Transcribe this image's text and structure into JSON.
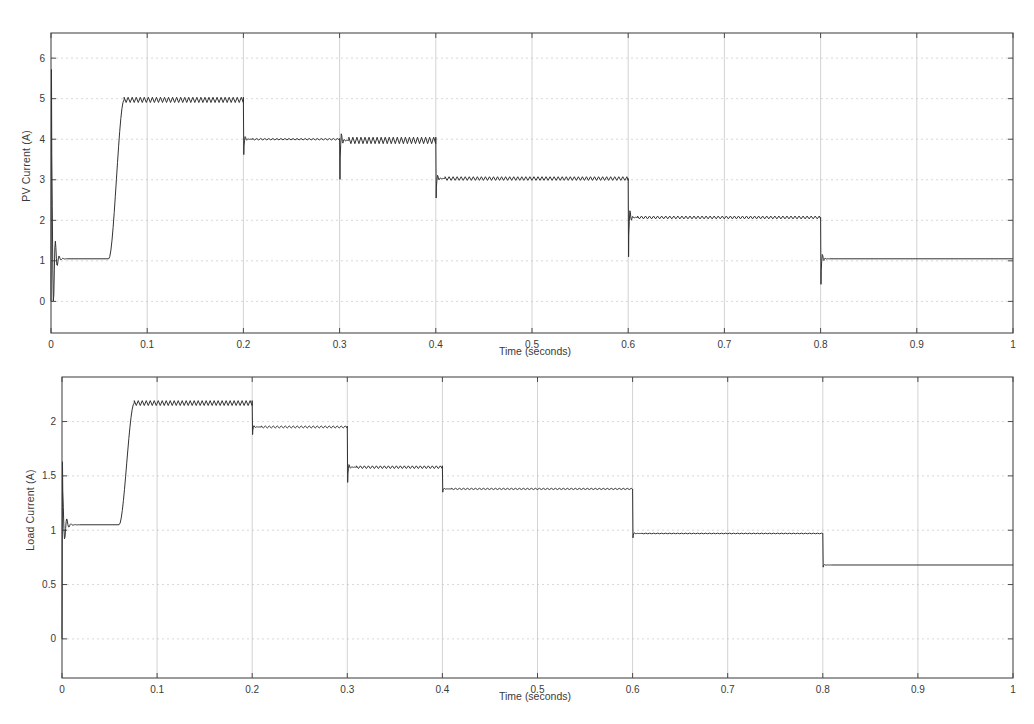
{
  "figure": {
    "background": "#ffffff",
    "trace_color": "#333333",
    "grid_color": "#bdbdbd",
    "axis_color": "#4a4a4a"
  },
  "chart_data": [
    {
      "id": "pv-current",
      "type": "line",
      "title": "",
      "xlabel": "Time (seconds)",
      "ylabel": "PV Current (A)",
      "xlim": [
        0,
        1
      ],
      "ylim": [
        -0.78,
        6.62
      ],
      "xticks": [
        0,
        0.1,
        0.2,
        0.3,
        0.4,
        0.5,
        0.6,
        0.7,
        0.8,
        0.9,
        1
      ],
      "xticklabels": [
        "0",
        "0.1",
        "0.2",
        "0.3",
        "0.4",
        "0.5",
        "0.6",
        "0.7",
        "0.8",
        "0.9",
        "1"
      ],
      "yticks": [
        0,
        1,
        2,
        3,
        4,
        5,
        6
      ],
      "yticklabels": [
        "0",
        "1",
        "2",
        "3",
        "4",
        "5",
        "6"
      ],
      "grid": true,
      "series": [
        {
          "name": "PV Current",
          "steps": [
            {
              "t_start": 0.0,
              "t_end": 0.06,
              "level": 1.05,
              "ripple": 0.0,
              "ripple_period": 0.004
            },
            {
              "t_start": 0.06,
              "t_end": 0.2,
              "level": 4.97,
              "ripple": 0.13,
              "ripple_period": 0.0042
            },
            {
              "t_start": 0.2,
              "t_end": 0.3,
              "level": 4.0,
              "ripple": 0.035,
              "ripple_period": 0.0042
            },
            {
              "t_start": 0.3,
              "t_end": 0.4,
              "level": 3.97,
              "ripple": 0.16,
              "ripple_period": 0.0042
            },
            {
              "t_start": 0.4,
              "t_end": 0.6,
              "level": 3.03,
              "ripple": 0.09,
              "ripple_period": 0.0042
            },
            {
              "t_start": 0.6,
              "t_end": 0.8,
              "level": 2.07,
              "ripple": 0.07,
              "ripple_period": 0.0042
            },
            {
              "t_start": 0.8,
              "t_end": 1.0,
              "level": 1.05,
              "ripple": 0.0,
              "ripple_period": 0.0042
            }
          ],
          "startup_transient": {
            "t": 0.0,
            "peak": 5.72,
            "trough": 0.0,
            "settle": 1.05,
            "duration": 0.016
          },
          "transitions": [
            {
              "t": 0.06,
              "kind": "ramp-up",
              "from": 1.05,
              "to": 4.97,
              "ramp": 0.016
            },
            {
              "t": 0.2,
              "kind": "step-down",
              "from": 4.97,
              "to": 4.0,
              "undershoot": 3.62
            },
            {
              "t": 0.3,
              "kind": "dip",
              "from": 4.0,
              "to": 3.97,
              "undershoot": 3.01
            },
            {
              "t": 0.4,
              "kind": "step-down",
              "from": 3.97,
              "to": 3.03,
              "undershoot": 2.55
            },
            {
              "t": 0.6,
              "kind": "step-down",
              "from": 3.03,
              "to": 2.07,
              "undershoot": 1.1
            },
            {
              "t": 0.8,
              "kind": "step-down",
              "from": 2.07,
              "to": 1.05,
              "undershoot": 0.42
            }
          ]
        }
      ]
    },
    {
      "id": "load-current",
      "type": "line",
      "title": "",
      "xlabel": "Time (seconds)",
      "ylabel": "Load Current (A)",
      "xlim": [
        0,
        1
      ],
      "ylim": [
        -0.36,
        2.41
      ],
      "xticks": [
        0,
        0.1,
        0.2,
        0.3,
        0.4,
        0.5,
        0.6,
        0.7,
        0.8,
        0.9,
        1
      ],
      "xticklabels": [
        "0",
        "0.1",
        "0.2",
        "0.3",
        "0.4",
        "0.5",
        "0.6",
        "0.7",
        "0.8",
        "0.9",
        "1"
      ],
      "yticks": [
        0,
        0.5,
        1,
        1.5,
        2
      ],
      "yticklabels": [
        "0",
        "0.5",
        "1",
        "1.5",
        "2"
      ],
      "grid": true,
      "series": [
        {
          "name": "Load Current",
          "steps": [
            {
              "t_start": 0.0,
              "t_end": 0.06,
              "level": 1.05,
              "ripple": 0.0,
              "ripple_period": 0.004
            },
            {
              "t_start": 0.06,
              "t_end": 0.2,
              "level": 2.17,
              "ripple": 0.045,
              "ripple_period": 0.0042
            },
            {
              "t_start": 0.2,
              "t_end": 0.3,
              "level": 1.95,
              "ripple": 0.018,
              "ripple_period": 0.0042
            },
            {
              "t_start": 0.3,
              "t_end": 0.4,
              "level": 1.58,
              "ripple": 0.025,
              "ripple_period": 0.0042
            },
            {
              "t_start": 0.4,
              "t_end": 0.6,
              "level": 1.38,
              "ripple": 0.012,
              "ripple_period": 0.0042
            },
            {
              "t_start": 0.6,
              "t_end": 0.8,
              "level": 0.97,
              "ripple": 0.006,
              "ripple_period": 0.0042
            },
            {
              "t_start": 0.8,
              "t_end": 1.0,
              "level": 0.68,
              "ripple": 0.0,
              "ripple_period": 0.0042
            }
          ],
          "startup_transient": {
            "t": 0.0,
            "peak": 1.63,
            "trough": 0.8,
            "settle": 1.05,
            "duration": 0.018
          },
          "transitions": [
            {
              "t": 0.06,
              "kind": "ramp-up",
              "from": 1.05,
              "to": 2.17,
              "ramp": 0.016
            },
            {
              "t": 0.2,
              "kind": "step-down",
              "from": 2.17,
              "to": 1.95,
              "undershoot": 1.88
            },
            {
              "t": 0.3,
              "kind": "step-down",
              "from": 1.95,
              "to": 1.58,
              "undershoot": 1.44
            },
            {
              "t": 0.4,
              "kind": "step-down",
              "from": 1.58,
              "to": 1.38,
              "undershoot": 1.35
            },
            {
              "t": 0.6,
              "kind": "step-down",
              "from": 1.38,
              "to": 0.97,
              "undershoot": 0.93
            },
            {
              "t": 0.8,
              "kind": "step-down",
              "from": 0.97,
              "to": 0.68,
              "undershoot": 0.66
            }
          ]
        }
      ]
    }
  ]
}
